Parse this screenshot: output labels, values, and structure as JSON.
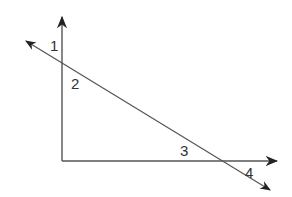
{
  "diagram": {
    "type": "angles formed by a transversal crossing two perpendicular lines",
    "angle_labels": {
      "a1": "1",
      "a2": "2",
      "a3": "3",
      "a4": "4"
    },
    "line_color": "#555555",
    "text_color": "#333333"
  }
}
